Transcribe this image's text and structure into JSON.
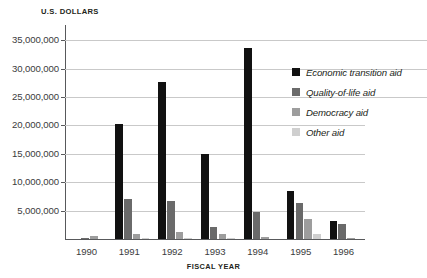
{
  "chart_data": {
    "type": "bar",
    "title": "",
    "ylabel": "U.S. DOLLARS",
    "xlabel": "FISCAL YEAR",
    "categories": [
      "1990",
      "1991",
      "1992",
      "1993",
      "1994",
      "1995",
      "1996"
    ],
    "ylim": [
      0,
      37500000
    ],
    "ytick_labels": [
      "5,000,000",
      "10,000,000",
      "15,000,000",
      "20,000,000",
      "25,000,000",
      "30,000,000",
      "35,000,000"
    ],
    "ytick_values": [
      5000000,
      10000000,
      15000000,
      20000000,
      25000000,
      30000000,
      35000000
    ],
    "grid": "horizontal",
    "legend_position": "right",
    "series": [
      {
        "name": "Economic transition aid",
        "color": "#111111",
        "values": [
          0,
          20300000,
          27700000,
          14900000,
          33700000,
          8500000,
          3200000
        ]
      },
      {
        "name": "Quality-of-life aid",
        "color": "#6a6a6a",
        "values": [
          150000,
          7000000,
          6700000,
          2200000,
          4700000,
          6300000,
          2700000
        ]
      },
      {
        "name": "Democracy aid",
        "color": "#9d9d9d",
        "values": [
          600000,
          900000,
          1300000,
          800000,
          300000,
          3500000,
          250000
        ]
      },
      {
        "name": "Other aid",
        "color": "#cfcfcf",
        "values": [
          0,
          200000,
          150000,
          200000,
          0,
          900000,
          0
        ]
      }
    ]
  },
  "legend": {
    "items": [
      {
        "label": "Economic transition aid"
      },
      {
        "label": "Quality-of-life aid"
      },
      {
        "label": "Democracy aid"
      },
      {
        "label": "Other aid"
      }
    ]
  }
}
